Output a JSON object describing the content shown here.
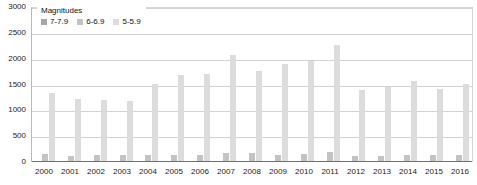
{
  "chart_data": {
    "type": "bar",
    "title": "",
    "xlabel": "",
    "ylabel": "",
    "ylim": [
      0,
      3000
    ],
    "ytick_values": [
      3000,
      2500,
      2000,
      1500,
      1000,
      500,
      0
    ],
    "ytick_labels": [
      "3000",
      "2500",
      "2000",
      "1500",
      "1000",
      "500",
      "0"
    ],
    "grid": true,
    "legend_position": "top-left",
    "legend_title": "Magnitudes",
    "categories": [
      "2000",
      "2001",
      "2002",
      "2003",
      "2004",
      "2005",
      "2006",
      "2007",
      "2008",
      "2009",
      "2010",
      "2011",
      "2012",
      "2013",
      "2014",
      "2015",
      "2016"
    ],
    "series": [
      {
        "name": "7-7.9",
        "color": "#a6a6a6",
        "values": [
          14,
          15,
          13,
          14,
          14,
          10,
          9,
          14,
          12,
          16,
          21,
          19,
          12,
          17,
          11,
          18,
          16
        ]
      },
      {
        "name": "6-6.9",
        "color": "#c3c3c3",
        "values": [
          146,
          121,
          127,
          140,
          141,
          140,
          142,
          178,
          168,
          144,
          150,
          185,
          108,
          123,
          143,
          127,
          130
        ]
      },
      {
        "name": "5-5.9",
        "color": "#dcdcdc",
        "values": [
          1345,
          1224,
          1201,
          1190,
          1515,
          1693,
          1712,
          2074,
          1768,
          1896,
          1963,
          2271,
          1401,
          1453,
          1574,
          1419,
          1502
        ]
      }
    ]
  },
  "legend": {
    "title": "Magnitudes",
    "items": [
      {
        "label": "7-7.9",
        "swatch": "series-0-swatch"
      },
      {
        "label": "6-6.9",
        "swatch": "series-1-swatch"
      },
      {
        "label": "5-5.9",
        "swatch": "series-2-swatch"
      }
    ]
  }
}
